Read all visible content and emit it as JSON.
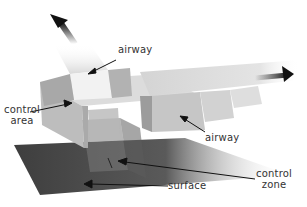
{
  "diagram": {
    "labels": {
      "airway_top": "airway",
      "airway_right": "airway",
      "control_area_line1": "control",
      "control_area_line2": "area",
      "control_zone_line1": "control",
      "control_zone_line2": "zone",
      "surface": "surface"
    },
    "colors": {
      "surface": "#4a4a4a",
      "block_light": "#e6e6e6",
      "block_mid": "#c4c4c4",
      "block_dark": "#9a9a9a",
      "arrow": "#111111",
      "text": "#333333"
    }
  }
}
